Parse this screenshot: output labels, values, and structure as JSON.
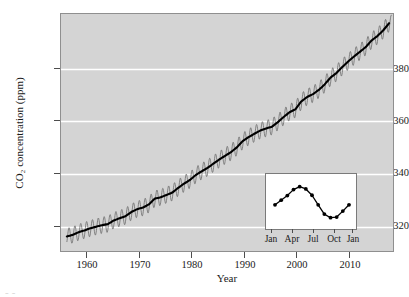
{
  "chart_data": {
    "type": "line",
    "title": "",
    "xlabel": "Year",
    "ylabel": "CO2 concentration (ppm)",
    "ylabel_display": "CO₂ concentration (ppm)",
    "xlim": [
      1957.0,
      2014.0
    ],
    "ylim": [
      309.0,
      400.0
    ],
    "xticks": [
      1960,
      1970,
      1980,
      1990,
      2000,
      2010
    ],
    "xticklabels": [
      "1960",
      "1970",
      "1980",
      "1990",
      "2000",
      "2010"
    ],
    "yticks": [
      320,
      340,
      360,
      380
    ],
    "yticklabels": [
      "320",
      "340",
      "360",
      "380"
    ],
    "grid": "horizontal-white-gridlines-on-gray-panel",
    "panel_color": "#d4d4d4",
    "gridline_color": "#ffffff",
    "line_color": "#000000",
    "seasonal_color": "#6e6e6e",
    "legend": "none",
    "series": [
      {
        "name": "Annual mean trend",
        "x": [
          1958,
          1959,
          1960,
          1961,
          1962,
          1963,
          1964,
          1965,
          1966,
          1967,
          1968,
          1969,
          1970,
          1971,
          1972,
          1973,
          1974,
          1975,
          1976,
          1977,
          1978,
          1979,
          1980,
          1981,
          1982,
          1983,
          1984,
          1985,
          1986,
          1987,
          1988,
          1989,
          1990,
          1991,
          1992,
          1993,
          1994,
          1995,
          1996,
          1997,
          1998,
          1999,
          2000,
          2001,
          2002,
          2003,
          2004,
          2005,
          2006,
          2007,
          2008,
          2009,
          2010,
          2011,
          2012,
          2013
        ],
        "values": [
          315.3,
          315.9,
          316.9,
          317.6,
          318.4,
          319.0,
          319.6,
          320.0,
          321.4,
          322.2,
          323.0,
          324.6,
          325.7,
          326.3,
          327.5,
          329.7,
          330.2,
          331.1,
          332.0,
          333.8,
          335.4,
          336.8,
          338.7,
          340.1,
          341.4,
          343.0,
          344.6,
          346.0,
          347.4,
          349.2,
          351.6,
          353.1,
          354.4,
          355.6,
          356.4,
          357.1,
          358.8,
          360.8,
          362.6,
          363.7,
          366.7,
          368.4,
          369.5,
          371.1,
          373.2,
          375.8,
          377.5,
          379.8,
          381.9,
          383.8,
          385.6,
          387.4,
          389.9,
          391.6,
          393.8,
          396.5
        ]
      },
      {
        "name": "Monthly observations (seasonal cycle)",
        "description": "Sawtooth oscillation about the trend, amplitude approximately 6 ppm peak-to-peak, maximum in May, minimum in September-October",
        "seasonal_amplitude_ppm": 3.1,
        "peak_month": "May",
        "trough_month": "September"
      }
    ]
  },
  "inset_chart": {
    "type": "line",
    "description": "Detail of the average annual seasonal cycle of CO2",
    "xticklabels": [
      "Jan",
      "Apr",
      "Jul",
      "Oct",
      "Jan"
    ],
    "xtick_months": [
      1,
      4,
      7,
      10,
      13
    ],
    "categories": [
      "Jan",
      "Feb",
      "Mar",
      "Apr",
      "May",
      "Jun",
      "Jul",
      "Aug",
      "Sep",
      "Oct",
      "Nov",
      "Dec",
      "Jan"
    ],
    "values": [
      -0.15,
      0.55,
      1.25,
      2.15,
      2.6,
      2.25,
      1.3,
      -0.15,
      -1.55,
      -2.1,
      -2.0,
      -1.1,
      -0.15
    ],
    "ylim": [
      -2.9,
      3.3
    ],
    "marker": "filled-circle",
    "line_color": "#000000",
    "panel_color": "#ffffff",
    "border_color": "#7a7a7a"
  },
  "caption_artifact": "--"
}
